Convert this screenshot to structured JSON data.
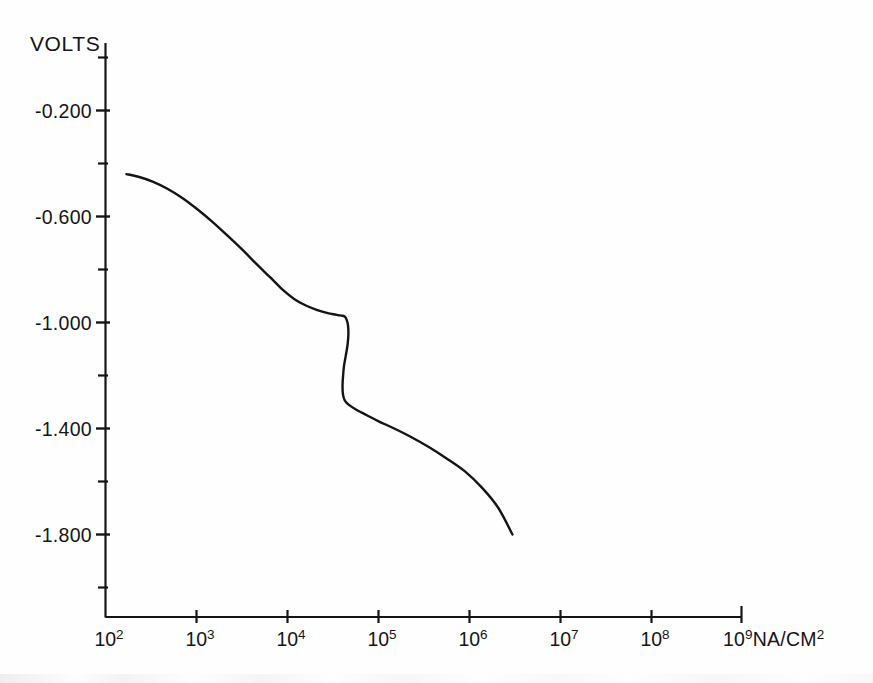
{
  "figure": {
    "background_color": "#fefefe",
    "line_color": "#141414",
    "axis_color": "#151515"
  },
  "axes": {
    "y_axis_title": "VOLTS",
    "x_unit_prefix": "10",
    "x_unit_exponent": "9",
    "x_unit_text": "NA/CM",
    "x_unit_superscript": "2",
    "y_tick_labels": [
      "-0.200",
      "-0.600",
      "-1.000",
      "-1.400",
      "-1.800"
    ],
    "x_tick_bases": [
      "10",
      "10",
      "10",
      "10",
      "10",
      "10",
      "10",
      "10"
    ],
    "x_tick_exponents": [
      "2",
      "3",
      "4",
      "5",
      "6",
      "7",
      "8",
      "9"
    ]
  },
  "chart_data": {
    "type": "line",
    "title": "",
    "xlabel": "10⁹NA/CM²",
    "ylabel": "VOLTS",
    "x_scale": "log",
    "y_scale": "linear",
    "xlim": [
      100,
      1000000000
    ],
    "ylim": [
      -1.96,
      -0.04
    ],
    "grid": false,
    "legend": false,
    "y_major_ticks": [
      -0.2,
      -0.6,
      -1.0,
      -1.4,
      -1.8
    ],
    "y_minor_ticks": [
      -0.4,
      -0.8,
      -1.2,
      -1.6
    ],
    "x_major_ticks": [
      100,
      1000,
      10000,
      100000,
      1000000,
      10000000,
      100000000,
      1000000000
    ],
    "series": [
      {
        "name": "polarization curve",
        "x": [
          170,
          230,
          330,
          480,
          700,
          1000,
          1500,
          2200,
          3200,
          4600,
          6500,
          9000,
          12000,
          16000,
          21000,
          26000,
          31000,
          36000,
          40000,
          43000,
          45000,
          46500,
          47000,
          46000,
          44000,
          42000,
          41000,
          40500,
          41000,
          43000,
          48000,
          58000,
          75000,
          100000,
          150000,
          230000,
          360000,
          560000,
          900000,
          1400000,
          2100000,
          3000000
        ],
        "y": [
          -0.44,
          -0.45,
          -0.468,
          -0.495,
          -0.53,
          -0.57,
          -0.62,
          -0.672,
          -0.725,
          -0.78,
          -0.83,
          -0.878,
          -0.912,
          -0.936,
          -0.952,
          -0.962,
          -0.968,
          -0.972,
          -0.974,
          -0.978,
          -0.99,
          -1.01,
          -1.045,
          -1.085,
          -1.125,
          -1.165,
          -1.205,
          -1.24,
          -1.272,
          -1.295,
          -1.312,
          -1.33,
          -1.35,
          -1.372,
          -1.4,
          -1.432,
          -1.47,
          -1.512,
          -1.562,
          -1.625,
          -1.7,
          -1.8
        ]
      }
    ]
  }
}
